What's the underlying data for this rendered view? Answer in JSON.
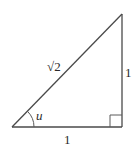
{
  "diagram": {
    "type": "right-triangle",
    "vertices": {
      "angle_vertex": [
        12,
        127
      ],
      "right_angle_vertex": [
        122,
        127
      ],
      "top_vertex": [
        122,
        14
      ]
    },
    "labels": {
      "hypotenuse": "√2",
      "vertical_leg": "1",
      "horizontal_leg": "1",
      "angle": "u"
    },
    "angle_mark": {
      "center": [
        12,
        127
      ],
      "radius": 22,
      "from_deg": 0,
      "to_deg": 45
    },
    "right_angle_box_size": 12,
    "colors": {
      "stroke": "#4a4a4a",
      "text": "#2a2a2a",
      "background": "#ffffff"
    }
  }
}
